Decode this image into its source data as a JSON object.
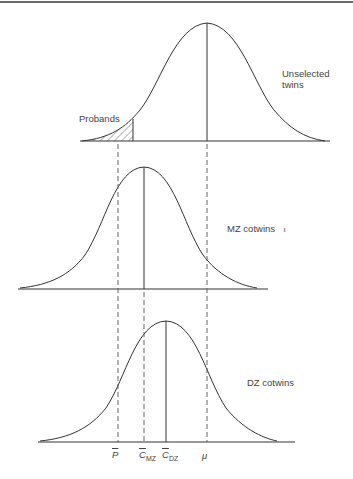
{
  "figure": {
    "curves": [
      {
        "id": "unselected",
        "label_line1": "Unselected",
        "label_line2": "twins",
        "mean_x": 207,
        "baseline_y": 141,
        "peak_y": 23,
        "sigma": 40
      },
      {
        "id": "mz",
        "label": "MZ cotwins",
        "stray_mark": "ι",
        "mean_x": 144,
        "baseline_y": 289,
        "peak_y": 167,
        "sigma": 40
      },
      {
        "id": "dz",
        "label": "DZ cotwins",
        "mean_x": 166,
        "baseline_y": 442,
        "peak_y": 321,
        "sigma": 42
      }
    ],
    "shaded_region_label": "Probands",
    "axis_labels": {
      "p_mean": "P",
      "c_mz": "C",
      "c_mz_sub": "MZ",
      "c_dz": "C",
      "c_dz_sub": "DZ",
      "mu": "μ"
    },
    "line_colors": {
      "curve": "#333333",
      "dashed": "#555555"
    }
  }
}
